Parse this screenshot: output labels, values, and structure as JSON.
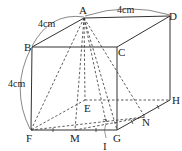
{
  "diagram": {
    "type": "geometry-cube",
    "vertices": {
      "A": "A",
      "B": "B",
      "C": "C",
      "D": "D",
      "E": "E",
      "F": "F",
      "G": "G",
      "H": "H",
      "M": "M",
      "N": "N",
      "I": "I"
    },
    "dimensions": {
      "ab": "4cm",
      "ad": "4cm",
      "bf": "4cm"
    },
    "colors": {
      "line": "#333333",
      "background": "#ffffff"
    }
  }
}
